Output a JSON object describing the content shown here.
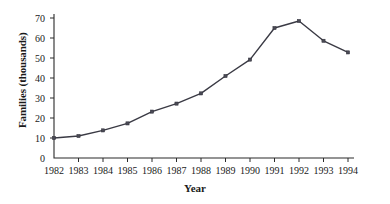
{
  "chart_data": {
    "type": "line",
    "title": "",
    "xlabel": "Year",
    "ylabel": "Families (thousands)",
    "categories": [
      "1982",
      "1983",
      "1984",
      "1985",
      "1986",
      "1987",
      "1988",
      "1989",
      "1990",
      "1991",
      "1992",
      "1993",
      "1994"
    ],
    "x": [
      1982,
      1983,
      1984,
      1985,
      1986,
      1987,
      1988,
      1989,
      1990,
      1991,
      1992,
      1993,
      1994
    ],
    "values": [
      10,
      11,
      13.8,
      17.3,
      23.2,
      27.2,
      32.3,
      41,
      49.2,
      65,
      68.5,
      58.6,
      52.8
    ],
    "series": [
      {
        "name": "Families",
        "values": [
          10,
          11,
          13.8,
          17.3,
          23.2,
          27.2,
          32.3,
          41,
          49.2,
          65,
          68.5,
          58.6,
          52.8
        ]
      }
    ],
    "ylim": [
      0,
      70
    ],
    "yticks": [
      0,
      10,
      20,
      30,
      40,
      50,
      60,
      70
    ],
    "ytick_labels": [
      "0",
      "10",
      "20",
      "30",
      "40",
      "50",
      "60",
      "70"
    ],
    "xlim": [
      1982,
      1994
    ],
    "xticks": [
      1982,
      1983,
      1984,
      1985,
      1986,
      1987,
      1988,
      1989,
      1990,
      1991,
      1992,
      1993,
      1994
    ],
    "grid": false,
    "legend": false,
    "legend_position": "none",
    "marker": "square",
    "line_color": "#3a3a44",
    "marker_color": "#4a4a55",
    "axis_color": "#2b2b2b",
    "background_color": "#ffffff"
  }
}
